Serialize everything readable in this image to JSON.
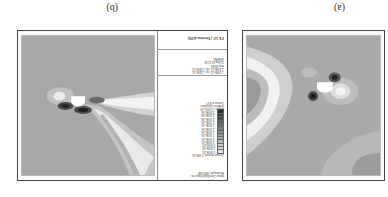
{
  "orientation": "rotated-180",
  "panels": [
    {
      "id": "a",
      "label": "(a)",
      "has_legend": false
    },
    {
      "id": "b",
      "label": "(b)",
      "has_legend": true,
      "legend": {
        "program": "FLAC (Version 4.00)",
        "subtitle": [
          "LEGEND",
          "15-Sep-04  12:06"
        ],
        "meta": [
          "step  24566",
          "-1.250E+01 <x< 1.250E+01",
          "-1.250E+01 <y< 1.250E+01"
        ],
        "contour_title": "Contour of SYY",
        "contour_range": [
          "Magfac = 0.000e+00",
          "Gradient Calculation"
        ],
        "levels": [
          {
            "value": "-2.500E+06",
            "color": "#2a2a2a"
          },
          {
            "value": "-2.250E+06",
            "color": "#3a3a3a"
          },
          {
            "value": "-2.000E+06",
            "color": "#4b4b4b"
          },
          {
            "value": "-1.750E+06",
            "color": "#5c5c5c"
          },
          {
            "value": "-1.500E+06",
            "color": "#6d6d6d"
          },
          {
            "value": "-1.250E+06",
            "color": "#7e7e7e"
          },
          {
            "value": "-1.000E+06",
            "color": "#8f8f8f"
          },
          {
            "value": "-7.500E+05",
            "color": "#9e9e9e"
          },
          {
            "value": "-5.000E+05",
            "color": "#adadad"
          },
          {
            "value": "-2.500E+05",
            "color": "#bcbcbc"
          },
          {
            "value": "0.000E+00",
            "color": "#cacaca"
          },
          {
            "value": "2.500E+05",
            "color": "#d8d8d8"
          },
          {
            "value": "5.000E+05",
            "color": "#e6e6e6"
          }
        ],
        "interval": "Contour interval= 2.50E+05",
        "footer": [
          "Itasca Consulting Group, Inc.",
          "Minneapolis, MN USA"
        ]
      }
    }
  ]
}
